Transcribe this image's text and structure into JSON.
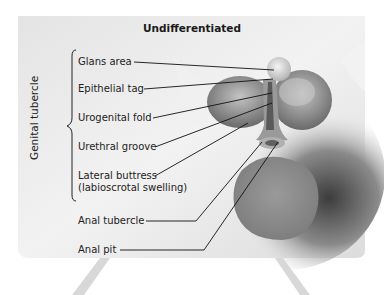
{
  "figure": {
    "title": "Undifferentiated",
    "group_label": "Genital tubercle",
    "labels": [
      {
        "id": "glans-area",
        "text": "Glans area"
      },
      {
        "id": "epithelial-tag",
        "text": "Epithelial tag"
      },
      {
        "id": "urogenital-fold",
        "text": "Urogenital fold"
      },
      {
        "id": "urethral-groove",
        "text": "Urethral groove"
      },
      {
        "id": "lateral-buttress",
        "text": "Lateral buttress"
      },
      {
        "id": "lateral-buttress-sub",
        "text": "(labioscrotal swelling)"
      },
      {
        "id": "anal-tubercle",
        "text": "Anal tubercle"
      },
      {
        "id": "anal-pit",
        "text": "Anal pit"
      }
    ]
  },
  "colors": {
    "panel_light": "#ededed",
    "panel_mid": "#c8c8c8",
    "shadow": "#5a5a5a",
    "anal_disc": "#8a8a8a",
    "leader_line": "#111111"
  }
}
